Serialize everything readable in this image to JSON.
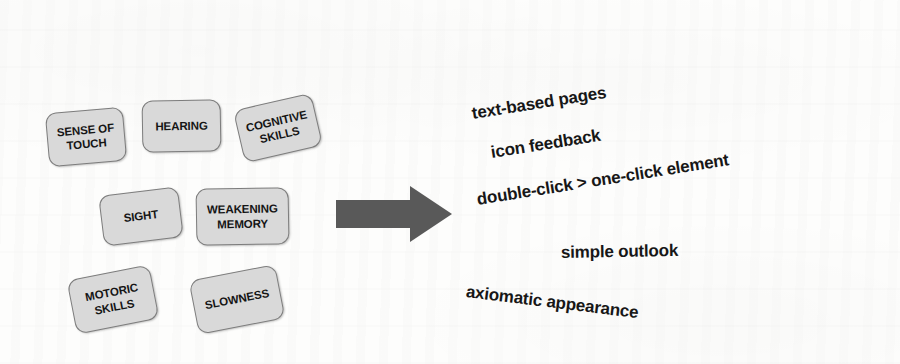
{
  "diagram": {
    "background_color": "#fdfdfc",
    "box_fill_color": "#d9d9d9",
    "box_border_color": "#7d7d7d",
    "arrow_color": "#595959",
    "text_color": "#171717"
  },
  "concepts": [
    {
      "id": "sense-of-touch",
      "lines": [
        "SENSE OF",
        "TOUCH"
      ],
      "x": 47,
      "y": 110,
      "w": 78,
      "h": 54,
      "rotate": -5
    },
    {
      "id": "hearing",
      "lines": [
        "HEARING"
      ],
      "x": 142,
      "y": 100,
      "w": 79,
      "h": 52,
      "rotate": -1
    },
    {
      "id": "cognitive-skills",
      "lines": [
        "COGNITIVE",
        "SKILLS"
      ],
      "x": 238,
      "y": 101,
      "w": 80,
      "h": 54,
      "rotate": -13
    },
    {
      "id": "sight",
      "lines": [
        "SIGHT"
      ],
      "x": 101,
      "y": 191,
      "w": 80,
      "h": 51,
      "rotate": -7
    },
    {
      "id": "weakening-memory",
      "lines": [
        "WEAKENING",
        "MEMORY"
      ],
      "x": 196,
      "y": 188,
      "w": 93,
      "h": 57,
      "rotate": -1
    },
    {
      "id": "motoric-skills",
      "lines": [
        "MOTORIC",
        "SKILLS"
      ],
      "x": 71,
      "y": 272,
      "w": 84,
      "h": 55,
      "rotate": -11
    },
    {
      "id": "slowness",
      "lines": [
        "SLOWNESS"
      ],
      "x": 193,
      "y": 272,
      "w": 88,
      "h": 55,
      "rotate": -11
    }
  ],
  "arrow": {
    "name": "right-block-arrow",
    "direction": "right"
  },
  "recommendations": [
    {
      "id": "text-based-pages",
      "label": "text-based pages",
      "x": 472,
      "y": 104,
      "rotate": -9,
      "size": 17
    },
    {
      "id": "icon-feedback",
      "label": "icon feedback",
      "x": 491,
      "y": 143,
      "rotate": -9,
      "size": 17
    },
    {
      "id": "double-vs-one-click",
      "label": "double-click > one-click element",
      "x": 477,
      "y": 190,
      "rotate": -9,
      "size": 17
    },
    {
      "id": "simple-outlook",
      "label": "simple outlook",
      "x": 561,
      "y": 243,
      "rotate": -1,
      "size": 17
    },
    {
      "id": "axiomatic-appearance",
      "label": "axiomatic appearance",
      "x": 466,
      "y": 282,
      "rotate": 7,
      "size": 17
    }
  ]
}
